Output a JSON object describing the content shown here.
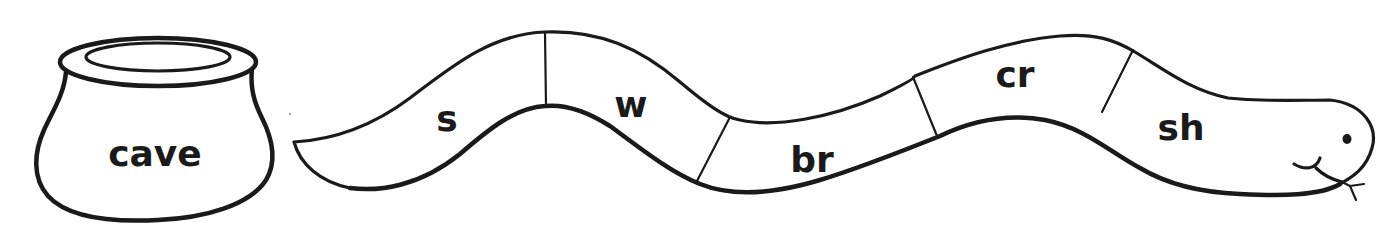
{
  "pot": {
    "label": "cave"
  },
  "snake": {
    "segments": [
      {
        "label": "s"
      },
      {
        "label": "w"
      },
      {
        "label": "br"
      },
      {
        "label": "cr"
      },
      {
        "label": "sh"
      }
    ]
  },
  "colors": {
    "ink": "#1a1a1a",
    "paper": "#ffffff"
  }
}
